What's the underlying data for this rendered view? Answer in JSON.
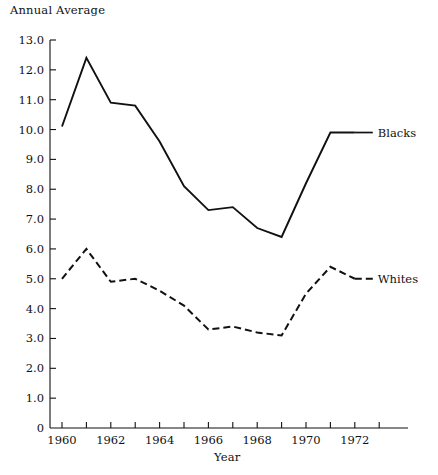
{
  "chart_data": {
    "type": "line",
    "title": "",
    "ylabel": "Annual Average",
    "xlabel": "Year",
    "ylim": [
      0,
      13
    ],
    "xlim": [
      1959.5,
      1973.2
    ],
    "grid": false,
    "legend_position": "right-inline",
    "x": [
      1960,
      1961,
      1962,
      1963,
      1964,
      1965,
      1966,
      1967,
      1968,
      1969,
      1970,
      1971,
      1972
    ],
    "y_ticks": [
      "0",
      "1.0",
      "2.0",
      "3.0",
      "4.0",
      "5.0",
      "6.0",
      "7.0",
      "8.0",
      "9.0",
      "10.0",
      "11.0",
      "12.0",
      "13.0"
    ],
    "y_tick_values": [
      0,
      1,
      2,
      3,
      4,
      5,
      6,
      7,
      8,
      9,
      10,
      11,
      12,
      13
    ],
    "x_ticks_major": [
      "1960",
      "1962",
      "1964",
      "1966",
      "1968",
      "1970",
      "1972"
    ],
    "x_tick_values_major": [
      1960,
      1962,
      1964,
      1966,
      1968,
      1970,
      1972
    ],
    "x_tick_values_minor": [
      1961,
      1963,
      1965,
      1967,
      1969,
      1971,
      1973
    ],
    "series": [
      {
        "name": "Blacks",
        "style": "solid",
        "color": "#111111",
        "values": [
          10.1,
          12.4,
          10.9,
          10.8,
          9.6,
          8.1,
          7.3,
          7.4,
          6.7,
          6.4,
          8.2,
          9.9,
          9.9
        ]
      },
      {
        "name": "Whites",
        "style": "dashed",
        "color": "#111111",
        "values": [
          5.0,
          6.0,
          4.9,
          5.0,
          4.6,
          4.1,
          3.3,
          3.4,
          3.2,
          3.1,
          4.5,
          5.4,
          5.0
        ]
      }
    ]
  }
}
